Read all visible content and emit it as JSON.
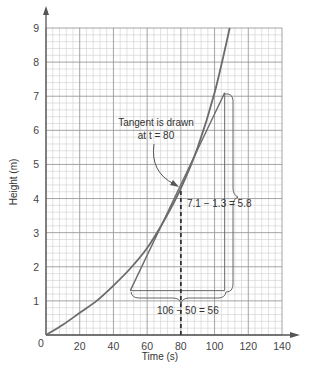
{
  "chart_data": {
    "type": "line",
    "title": "",
    "xlabel": "Time (s)",
    "ylabel": "Height (m)",
    "xlim": [
      0,
      140
    ],
    "ylim": [
      0,
      9
    ],
    "xticks": [
      0,
      20,
      40,
      60,
      80,
      100,
      120,
      140
    ],
    "yticks": [
      1,
      2,
      3,
      4,
      5,
      6,
      7,
      8,
      9
    ],
    "x_tick_labels": [
      "0",
      "20",
      "40",
      "60",
      "80",
      "100",
      "120",
      "140"
    ],
    "y_tick_labels": [
      "1",
      "2",
      "3",
      "4",
      "5",
      "6",
      "7",
      "8",
      "9"
    ],
    "grid": true,
    "legend": null,
    "series": [
      {
        "name": "Height curve",
        "x": [
          0,
          10,
          20,
          30,
          40,
          50,
          60,
          70,
          80,
          90,
          100,
          109
        ],
        "y": [
          0,
          0.3,
          0.65,
          1.0,
          1.45,
          1.95,
          2.55,
          3.35,
          4.3,
          5.5,
          7.1,
          9.0
        ]
      },
      {
        "name": "Tangent at t = 80",
        "x": [
          50,
          106
        ],
        "y": [
          1.3,
          7.1
        ]
      }
    ],
    "annotations": [
      {
        "text": "Tangent is drawn",
        "line2": "at t = 80",
        "arrow_to": [
          80,
          4.3
        ]
      },
      {
        "text": "7.1 − 1.3 = 5.8",
        "describes": "vertical rise"
      },
      {
        "text": "106 − 50 = 56",
        "describes": "horizontal run"
      }
    ],
    "dashed_line": {
      "x": 80,
      "from_y": 0,
      "to_y": 4.3
    },
    "origin_label": "0"
  }
}
